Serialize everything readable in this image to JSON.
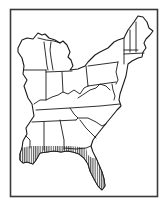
{
  "map": {
    "title": "Eastern United States range map",
    "region": "Eastern United States",
    "highlighted_region": "Gulf Coast and Florida peninsula (hatched)",
    "colors": {
      "background": "#ffffff",
      "outline": "#1a1a1a",
      "frame": "#3a3a3a",
      "hatch": "#1a1a1a"
    },
    "legend": {
      "hatched": "Range / distribution area"
    }
  }
}
